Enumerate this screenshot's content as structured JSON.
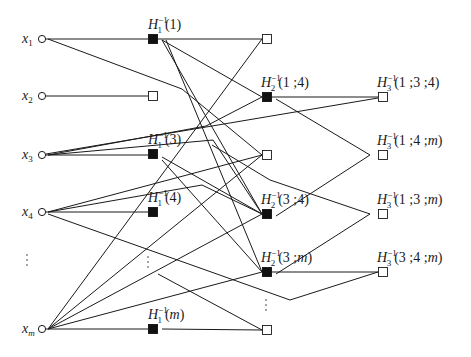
{
  "diagram": {
    "type": "layered-graph",
    "sources": [
      {
        "id": "x1",
        "var": "x",
        "sub": "1",
        "cx": 42,
        "cy": 39
      },
      {
        "id": "x2",
        "var": "x",
        "sub": "2",
        "cx": 42,
        "cy": 96
      },
      {
        "id": "x3",
        "var": "x",
        "sub": "3",
        "cx": 42,
        "cy": 155
      },
      {
        "id": "x4",
        "var": "x",
        "sub": "4",
        "cx": 42,
        "cy": 212
      },
      {
        "id": "xm",
        "var": "x",
        "sub": "m",
        "cx": 42,
        "cy": 329
      }
    ],
    "layer1": [
      {
        "id": "h1_1",
        "filled": true,
        "x": 153,
        "y": 39,
        "label": {
          "H": "H",
          "sub": "1",
          "sup": "−1",
          "arg": "(1)"
        }
      },
      {
        "id": "h1_2",
        "filled": false,
        "x": 153,
        "y": 96
      },
      {
        "id": "h1_3",
        "filled": true,
        "x": 153,
        "y": 154,
        "label": {
          "H": "H",
          "sub": "1",
          "sup": "−1",
          "arg": "(3)"
        }
      },
      {
        "id": "h1_4",
        "filled": true,
        "x": 153,
        "y": 212,
        "label": {
          "H": "H",
          "sub": "1",
          "sup": "−1",
          "arg": "(4)"
        }
      },
      {
        "id": "h1_m",
        "filled": true,
        "x": 153,
        "y": 329,
        "label": {
          "H": "H",
          "sub": "1",
          "sup": "−1",
          "arg": "(m)"
        }
      }
    ],
    "layer2": [
      {
        "id": "h2_a",
        "filled": false,
        "x": 267,
        "y": 39
      },
      {
        "id": "h2_14",
        "filled": true,
        "x": 267,
        "y": 97,
        "label": {
          "H": "H",
          "sub": "2",
          "sup": "−1",
          "arg": "(1 ;4)"
        }
      },
      {
        "id": "h2_b",
        "filled": false,
        "x": 267,
        "y": 155
      },
      {
        "id": "h2_34",
        "filled": true,
        "x": 267,
        "y": 214,
        "label": {
          "H": "H",
          "sub": "2",
          "sup": "−1",
          "arg": "(3 ;4)"
        }
      },
      {
        "id": "h2_3m",
        "filled": true,
        "x": 267,
        "y": 272,
        "label": {
          "H": "H",
          "sub": "2",
          "sup": "−1",
          "arg": "(3 ;m)"
        }
      },
      {
        "id": "h2_c",
        "filled": false,
        "x": 267,
        "y": 330
      }
    ],
    "layer3": [
      {
        "id": "h3_134",
        "filled": false,
        "x": 383,
        "y": 97,
        "label": {
          "H": "H",
          "sub": "3",
          "sup": "−1",
          "arg": "(1 ;3 ;4)"
        }
      },
      {
        "id": "h3_14m",
        "filled": false,
        "x": 383,
        "y": 155,
        "label": {
          "H": "H",
          "sub": "3",
          "sup": "−1",
          "arg": "(1 ;4 ;m)"
        }
      },
      {
        "id": "h3_13m",
        "filled": false,
        "x": 383,
        "y": 214,
        "label": {
          "H": "H",
          "sub": "3",
          "sup": "−1",
          "arg": "(1 ;3 ;m)"
        }
      },
      {
        "id": "h3_34m",
        "filled": false,
        "x": 383,
        "y": 272,
        "label": {
          "H": "H",
          "sub": "3",
          "sup": "−1",
          "arg": "(3 ;4 ;m)"
        }
      }
    ],
    "ellipsis": [
      {
        "x": 27,
        "y": 255
      },
      {
        "x": 148,
        "y": 257
      },
      {
        "x": 266,
        "y": 300
      }
    ],
    "edges": [
      "46,39 148,39",
      "158,39 262,39",
      "48,39 182,89 262,155",
      "46,96 148,96",
      "162,40 262,97",
      "162,40 262,214",
      "166,40 262,272",
      "48,329 262,39",
      "46,154 378,98",
      "46,155 148,155",
      "48,155 213,140 262,214",
      "48,155 206,126 262,97",
      "162,157 262,214",
      "162,160 262,272",
      "46,212 148,212",
      "48,212 202,185 262,214",
      "48,212 262,155",
      "48,214 290,300 378,272",
      "48,329 262,214",
      "48,329 262,155",
      "48,329 262,272",
      "46,329 148,329",
      "162,329 262,330",
      "158,274 262,330",
      "272,97 378,97",
      "276,99 370,155",
      "212,145 270,180 370,214",
      "276,216 370,155",
      "276,274 370,214",
      "272,272 378,272"
    ]
  }
}
